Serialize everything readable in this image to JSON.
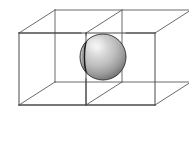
{
  "figure": {
    "caption": "",
    "background_color": "#ffffff",
    "canvas": {
      "width": 189,
      "height": 143
    }
  },
  "wireframe": {
    "name": "two-cell rectangular box lattice",
    "stroke_color": "#5a5a5a",
    "stroke_width": 0.9,
    "projection": "oblique cabinet projection",
    "depth_offset": {
      "dx": 36,
      "dy": -23
    },
    "front_face": {
      "name": "front-face-rectangle",
      "left": 19,
      "top": 33,
      "right": 155,
      "bottom": 105,
      "width": 136,
      "height": 72
    },
    "back_face": {
      "name": "back-face-rectangle",
      "left": 55,
      "top": 10,
      "right": 191,
      "bottom": 82,
      "width": 136,
      "height": 72
    },
    "divider": {
      "name": "middle-partition",
      "front_x": 86,
      "back_x": 122,
      "description": "vertical partition splitting the box into two cubic cells"
    },
    "vertices": [
      {
        "name": "front-top-left",
        "x": 19,
        "y": 33
      },
      {
        "name": "front-top-right",
        "x": 155,
        "y": 33
      },
      {
        "name": "front-bottom-left",
        "x": 19,
        "y": 105
      },
      {
        "name": "front-bottom-right",
        "x": 155,
        "y": 105
      },
      {
        "name": "back-top-left",
        "x": 55,
        "y": 10
      },
      {
        "name": "back-top-right",
        "x": 191,
        "y": 10
      },
      {
        "name": "back-bottom-left",
        "x": 55,
        "y": 82
      },
      {
        "name": "back-bottom-right",
        "x": 191,
        "y": 82
      },
      {
        "name": "front-top-middle",
        "x": 86,
        "y": 33
      },
      {
        "name": "front-bottom-middle",
        "x": 86,
        "y": 105
      },
      {
        "name": "back-top-middle",
        "x": 122,
        "y": 10
      },
      {
        "name": "back-bottom-middle",
        "x": 122,
        "y": 82
      }
    ]
  },
  "sphere": {
    "name": "shaded-sphere",
    "center_x": 103,
    "center_y": 57,
    "radius": 23,
    "fill_light": "#e8e8e8",
    "fill_mid": "#b0b0b0",
    "fill_dark": "#6e6e6e",
    "outline_color": "#3c3c3c",
    "outline_width": 1.0,
    "highlight": {
      "x": 94,
      "y": 44,
      "radius": 11
    },
    "meridian": {
      "name": "meridian-arc",
      "color": "#1e1e1e",
      "width": 1.6,
      "description": "dark crescent arc near the left limb of the sphere"
    }
  }
}
